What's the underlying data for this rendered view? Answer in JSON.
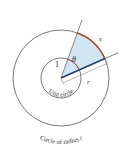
{
  "diagram": {
    "labels": {
      "arc_length": "s",
      "angle": "θ",
      "unit_radius": "1",
      "radius": "r",
      "unit_circle": "Unit circle",
      "outer_circle": "Circle of radius r"
    },
    "colors": {
      "sector_fill": "#cfe5f3",
      "arc": "#b5452e",
      "radius_line": "#1f3f6b",
      "circle_stroke": "#555555"
    },
    "geometry": {
      "center": [
        61,
        78
      ],
      "unit_radius_px": 20,
      "outer_radius_px": 48,
      "upper_ray_angle_deg": 70,
      "lower_ray_angle_deg": 24
    }
  }
}
